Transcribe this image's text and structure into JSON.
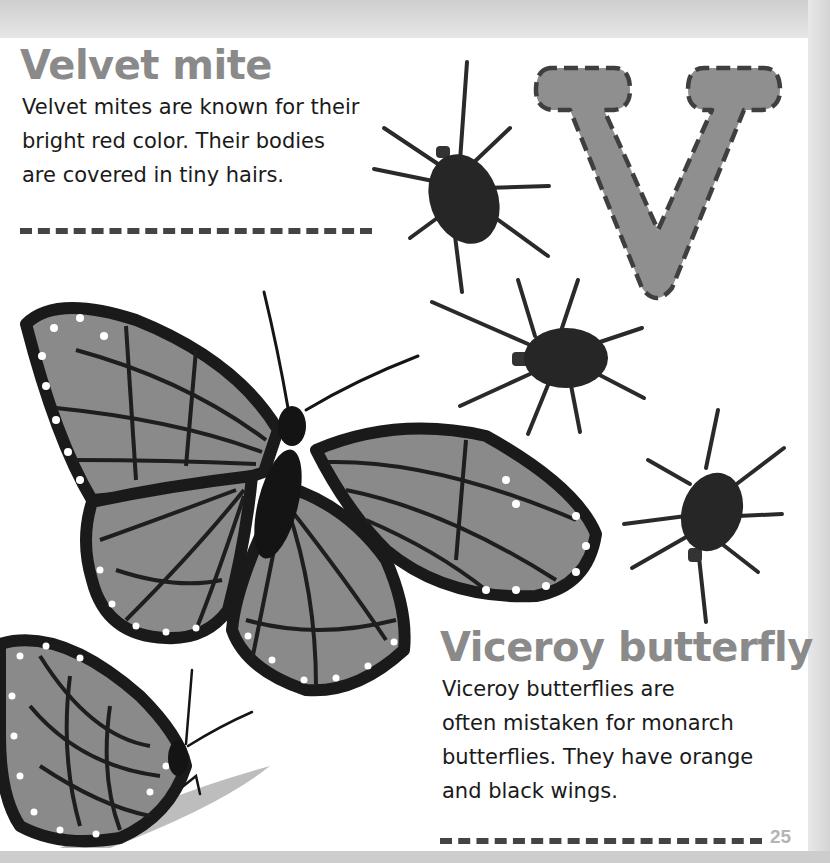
{
  "page": {
    "letter": "V",
    "page_number": "25",
    "colors": {
      "heading": "#8a8a8a",
      "body_text": "#1a1a1a",
      "letter_fill": "#8f8f8f",
      "letter_outline": "#3f3f3f",
      "divider": "#444444",
      "page_bg": "#ffffff",
      "margin_bg": "#d9d9d9"
    }
  },
  "sections": [
    {
      "title": "Velvet mite",
      "lines": [
        "Velvet mites are known for their",
        "bright red color. Their bodies",
        "are covered in tiny hairs."
      ]
    },
    {
      "title": "Viceroy butterfly",
      "lines": [
        "Viceroy butterflies are",
        "often mistaken for monarch",
        "butterflies. They have orange",
        "and black wings."
      ]
    }
  ],
  "illustrations": [
    {
      "name": "velvet-mite",
      "count": 3
    },
    {
      "name": "viceroy-butterfly-open-wings"
    },
    {
      "name": "viceroy-butterfly-side-view-on-leaf"
    }
  ]
}
